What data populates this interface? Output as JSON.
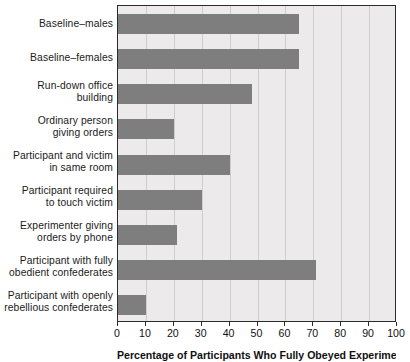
{
  "chart_data": {
    "type": "bar",
    "orientation": "horizontal",
    "title": "",
    "xlabel": "Percentage of Participants Who Fully Obeyed Experimenter",
    "ylabel": "",
    "xlim": [
      0,
      100
    ],
    "xticks": [
      0,
      10,
      20,
      30,
      40,
      50,
      60,
      70,
      80,
      90,
      100
    ],
    "grid": true,
    "legend": false,
    "bar_color": "#7e7e7e",
    "plot_background": "#eceaea",
    "frame_color": "#2b2b2b",
    "categories": [
      "Baseline–males",
      "Baseline–females",
      "Run-down office building",
      "Ordinary person giving orders",
      "Participant and victim in same room",
      "Participant required to touch victim",
      "Experimenter giving orders by phone",
      "Participant with fully obedient confederates",
      "Participant with openly rebellious confederates"
    ],
    "category_lines": [
      [
        "Baseline–males"
      ],
      [
        "Baseline–females"
      ],
      [
        "Run-down office",
        "building"
      ],
      [
        "Ordinary person",
        "giving orders"
      ],
      [
        "Participant and victim",
        "in same room"
      ],
      [
        "Participant required",
        "to touch victim"
      ],
      [
        "Experimenter giving",
        "orders by phone"
      ],
      [
        "Participant with fully",
        "obedient confederates"
      ],
      [
        "Participant with openly",
        "rebellious confederates"
      ]
    ],
    "values": [
      65,
      65,
      48,
      20,
      40,
      30,
      21,
      71,
      10
    ]
  },
  "axis": {
    "tick_labels": [
      "0",
      "10",
      "20",
      "30",
      "40",
      "50",
      "60",
      "70",
      "80",
      "90",
      "100"
    ],
    "title_clipped": "Percentage of Participants Who Fully Obeyed Experimenter"
  }
}
